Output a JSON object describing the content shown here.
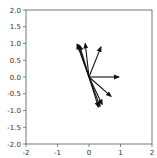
{
  "chart_data": {
    "type": "quiver",
    "title": "",
    "xlabel": "",
    "ylabel": "",
    "xlim": [
      -2,
      2
    ],
    "ylim": [
      -2,
      2
    ],
    "grid": false,
    "legend": null,
    "xticks": [
      -2,
      -1,
      0,
      1,
      2
    ],
    "xtick_labels": [
      "-2",
      "-1",
      "0",
      "1",
      "2"
    ],
    "yticks": [
      2.0,
      1.5,
      1.0,
      0.5,
      0.0,
      -0.5,
      -1.0,
      -1.5,
      -2.0
    ],
    "ytick_labels": [
      "2.0",
      "1.5",
      "1.0",
      "0.5",
      "0.0",
      "-0.5",
      "-1.0",
      "-1.5",
      "-2.0"
    ],
    "origin": [
      0,
      0
    ],
    "vectors": [
      {
        "u": -0.38,
        "v": 0.98
      },
      {
        "u": -0.34,
        "v": 0.96
      },
      {
        "u": -0.3,
        "v": 0.95
      },
      {
        "u": -0.12,
        "v": 1.0
      },
      {
        "u": 0.38,
        "v": 0.9
      },
      {
        "u": 0.95,
        "v": 0.0
      },
      {
        "u": 0.7,
        "v": -0.58
      },
      {
        "u": 0.42,
        "v": -0.82
      },
      {
        "u": 0.35,
        "v": -0.88
      },
      {
        "u": 0.3,
        "v": -0.9
      }
    ],
    "arrow_color": "#111111"
  },
  "plot": {
    "frame_color": "#555555",
    "background": "#ffffff"
  }
}
